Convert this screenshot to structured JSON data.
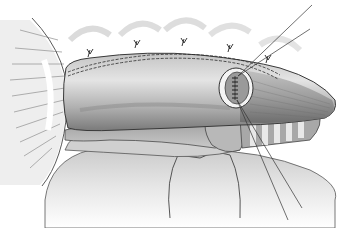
{
  "illustration": {
    "kind": "surgical anatomical drawing",
    "style": "grayscale pencil shading",
    "colors": {
      "background": "#ffffff",
      "organ_light": "#d6d6d6",
      "organ_mid": "#a8a8a8",
      "organ_dark": "#6e6e6e",
      "outline": "#3a3a3a",
      "suture": "#2a2a2a"
    },
    "elements": [
      "retracted-tissue-left",
      "tubular-organ-main",
      "suture-line-dashed",
      "stay-sutures",
      "anastomosis-window",
      "tapered-organ-tip",
      "ringed-tube-trachea",
      "underlying-tissue",
      "suture-threads"
    ]
  }
}
